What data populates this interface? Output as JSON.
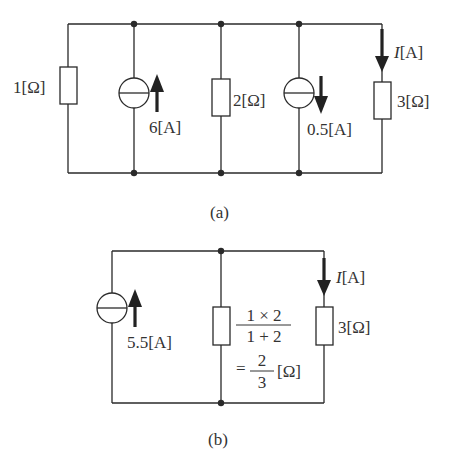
{
  "figure_a": {
    "caption": "(a)",
    "r1_label": "1[Ω]",
    "source1_label": "6[A]",
    "r2_label": "2[Ω]",
    "source2_label": "0.5[A]",
    "current_symbol": "I",
    "current_unit": "[A]",
    "r3_label": "3[Ω]"
  },
  "figure_b": {
    "caption": "(b)",
    "source_label": "5.5[A]",
    "req_numerator": "1 × 2",
    "req_denominator": "1 + 2",
    "req_eq_prefix": "=",
    "req_frac_num": "2",
    "req_frac_den": "3",
    "req_unit": "[Ω]",
    "current_symbol": "I",
    "current_unit": "[A]",
    "r3_label": "3[Ω]"
  },
  "colors": {
    "line": "#2a2a2a",
    "text": "#333333",
    "background": "#ffffff"
  }
}
